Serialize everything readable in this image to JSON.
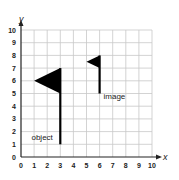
{
  "diagram": {
    "type": "coordinate-grid-translation",
    "x_axis_label": "x",
    "y_axis_label": "y",
    "x_ticks": [
      "0",
      "1",
      "2",
      "3",
      "4",
      "5",
      "6",
      "7",
      "8",
      "9",
      "10"
    ],
    "y_ticks": [
      "0",
      "1",
      "2",
      "3",
      "4",
      "5",
      "6",
      "7",
      "8",
      "9",
      "10"
    ],
    "x_range": [
      0,
      10
    ],
    "y_range": [
      0,
      10
    ],
    "grid": true,
    "colors": {
      "grid": "#c8c8c8",
      "axis": "#222222",
      "figure": "#000000"
    },
    "object": {
      "label": "object",
      "pole": [
        [
          3,
          1
        ],
        [
          3,
          7
        ]
      ],
      "flag": [
        [
          1,
          6
        ],
        [
          3,
          7
        ],
        [
          3,
          5
        ]
      ],
      "label_pos": [
        0.8,
        1.3
      ]
    },
    "image": {
      "label": "image",
      "pole": [
        [
          6,
          5
        ],
        [
          6,
          8
        ]
      ],
      "flag": [
        [
          5,
          7.5
        ],
        [
          6,
          8
        ],
        [
          6,
          7
        ]
      ],
      "label_pos": [
        6.3,
        4.6
      ]
    }
  }
}
